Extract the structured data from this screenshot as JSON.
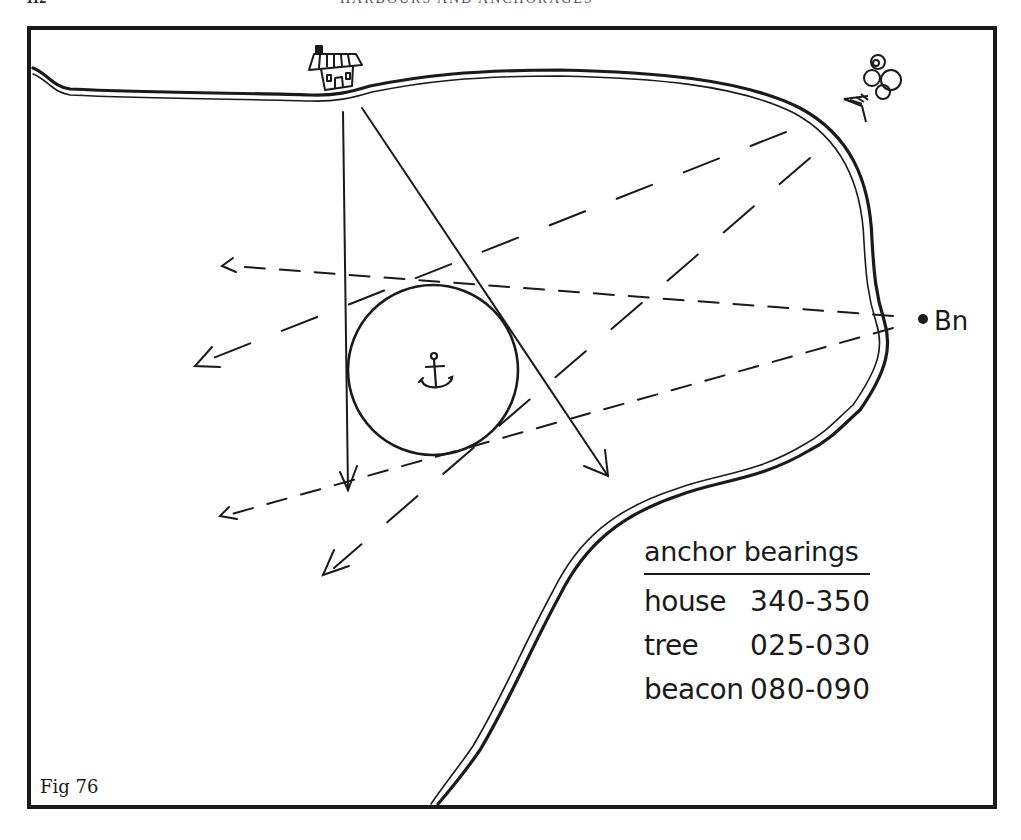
{
  "page": {
    "page_number": "112",
    "running_head": "HARBOURS AND ANCHORAGES"
  },
  "figure": {
    "label": "Fig 76",
    "frame_color": "#1a1a1a",
    "ink_color": "#1a1a1a"
  },
  "landmarks": {
    "house": {
      "icon": "house-icon",
      "name": "house"
    },
    "tree": {
      "icon": "tree-icon",
      "name": "tree"
    },
    "beacon": {
      "icon": "beacon-dot-icon",
      "label": "Bn"
    },
    "anchor": {
      "icon": "anchor-icon"
    }
  },
  "legend": {
    "title": "anchor bearings",
    "rows": [
      {
        "name": "house",
        "range": "340-350"
      },
      {
        "name": "tree",
        "range": "025-030"
      },
      {
        "name": "beacon",
        "range": "080-090"
      }
    ]
  },
  "bearing_lines": [
    {
      "landmark": "house",
      "style": "solid",
      "from": [
        343,
        112
      ],
      "to": [
        348,
        490
      ]
    },
    {
      "landmark": "house",
      "style": "solid",
      "from": [
        362,
        108
      ],
      "to": [
        608,
        476
      ]
    },
    {
      "landmark": "tree",
      "style": "long-dash",
      "from": [
        786,
        132
      ],
      "to": [
        195,
        366
      ]
    },
    {
      "landmark": "tree",
      "style": "long-dash",
      "from": [
        810,
        158
      ],
      "to": [
        322,
        575
      ]
    },
    {
      "landmark": "beacon",
      "style": "short-dash",
      "from": [
        893,
        316
      ],
      "to": [
        222,
        264
      ]
    },
    {
      "landmark": "beacon",
      "style": "short-dash",
      "from": [
        893,
        328
      ],
      "to": [
        220,
        516
      ]
    }
  ],
  "swing_circle": {
    "cx": 433,
    "cy": 370,
    "r": 85
  }
}
